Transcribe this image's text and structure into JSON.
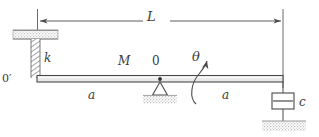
{
  "diagram": {
    "type": "free-body-schematic",
    "colors": {
      "line": "#4a4a4a",
      "beam_fill": "#e8e8e8",
      "hatch": "#b9b9b9",
      "text": "#3a3a3a",
      "background": "#ffffff"
    },
    "labels": {
      "total_length": "L",
      "spring_stiffness": "k",
      "left_end_point": "0′",
      "beam_mass": "M",
      "pivot_point": "0",
      "rotation_angle": "θ",
      "left_half_length": "a",
      "right_half_length": "a",
      "damping_coefficient": "c"
    },
    "geometry": {
      "beam_left_x": 37,
      "beam_right_x": 283,
      "beam_y": 79,
      "beam_thickness": 7,
      "pivot_x": 160,
      "dimension_line_y": 21
    },
    "components": [
      {
        "name": "ceiling-support",
        "kind": "fixed-hatched-surface",
        "position": "top-left"
      },
      {
        "name": "spring",
        "kind": "spring",
        "label": "k",
        "position": "left"
      },
      {
        "name": "rigid-beam",
        "kind": "beam",
        "label": "M",
        "position": "center"
      },
      {
        "name": "pivot-support",
        "kind": "triangular-pin-support",
        "label": "0",
        "position": "center"
      },
      {
        "name": "rotation-arrow",
        "kind": "curved-arrow",
        "label": "θ",
        "direction": "counterclockwise"
      },
      {
        "name": "dashpot-damper",
        "kind": "damper",
        "label": "c",
        "position": "right"
      },
      {
        "name": "ground-support",
        "kind": "fixed-hatched-surface",
        "position": "bottom-right"
      },
      {
        "name": "length-dimension",
        "kind": "dimension-line",
        "label": "L",
        "position": "top"
      }
    ]
  }
}
